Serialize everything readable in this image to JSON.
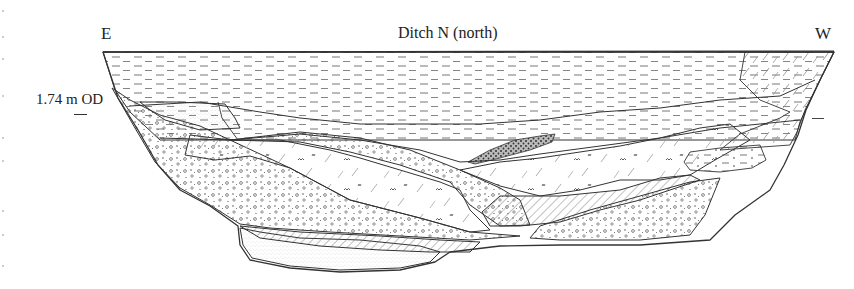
{
  "figure": {
    "title": "Ditch N (north)",
    "orientation_left": "E",
    "orientation_right": "W",
    "datum_label": "1.74 m OD"
  },
  "layers": [
    {
      "name": "upper-fill",
      "pattern": "horizontal-dashes"
    },
    {
      "name": "silty-fill",
      "pattern": "diagonal-dashes"
    },
    {
      "name": "organic-fill",
      "pattern": "diagonal-dashes-with-m-marks"
    },
    {
      "name": "gravelly-fill",
      "pattern": "circles-and-dots"
    },
    {
      "name": "dense-lens",
      "pattern": "dense-stipple"
    },
    {
      "name": "hatched-layer",
      "pattern": "diagonal-hatching"
    },
    {
      "name": "basal-sand",
      "pattern": "fine-stipple"
    }
  ],
  "colors": {
    "ink": "#333333",
    "background": "#ffffff"
  }
}
